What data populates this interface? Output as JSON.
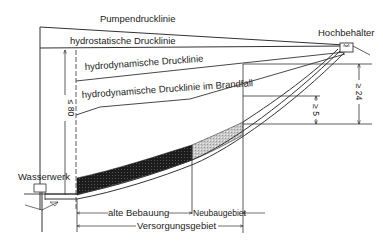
{
  "diagram": {
    "type": "pressure-line diagram (water supply)",
    "labels": {
      "pump_pressure_line": "Pumpendrucklinie",
      "hydrostatic_pressure_line": "hydrostatische Drucklinie",
      "hydrodynamic_pressure_line": "hydrodynamische Drucklinie",
      "hydrodynamic_fire_line": "hydrodynamische Drucklinie im Brandfall",
      "elevated_tank": "Hochbehälter",
      "waterworks": "Wasserwerk",
      "old_development": "alte Bebauung",
      "new_development": "Neubaugebiet",
      "supply_area": "Versorgungsgebiet"
    },
    "dimensions": {
      "max_pressure": "≤ 80",
      "min_fire_pressure": "≥ 5",
      "min_static_pressure": "≥ 24"
    },
    "colors": {
      "line": "#333333",
      "old_area_fill": "#1a1a1a",
      "new_area_fill": "#bdbdbd"
    }
  }
}
